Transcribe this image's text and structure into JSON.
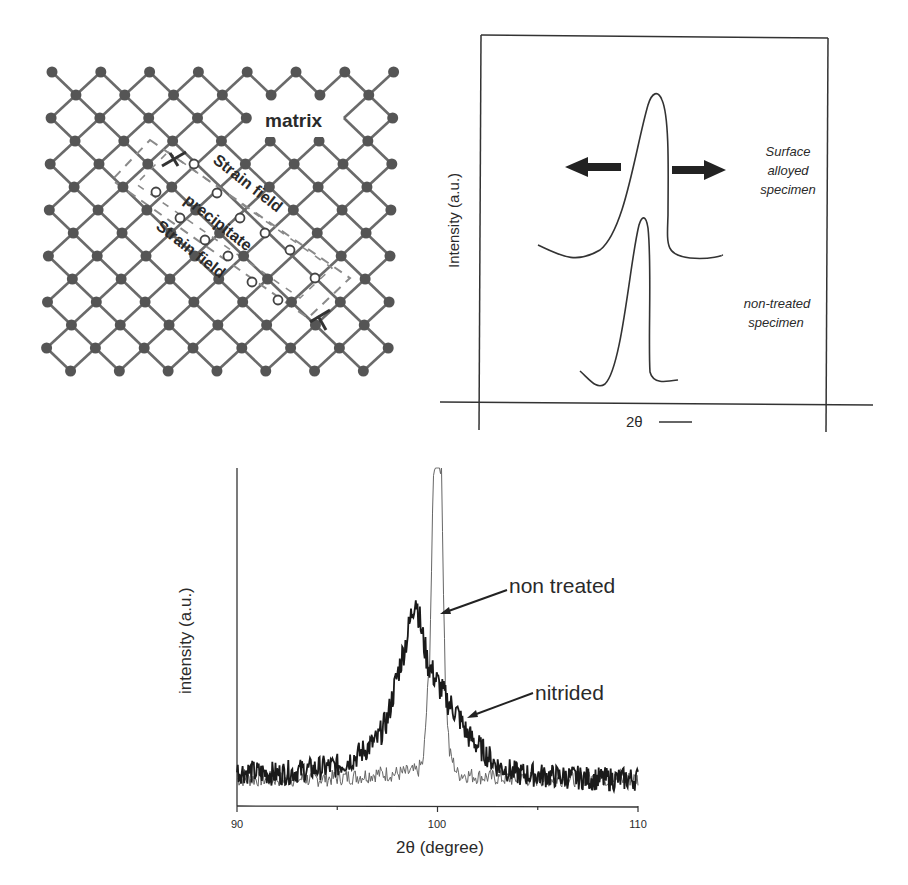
{
  "figure": {
    "lattice_diagram": {
      "labels": {
        "matrix": "matrix",
        "strain_field_upper": "Strain field",
        "precipitate": "precipitate",
        "strain_field_lower": "Strain field"
      },
      "colors": {
        "atom": "#555555",
        "bond": "#6a6a6a",
        "precipitate_atom": "#ffffff",
        "dash": "#8a8a8a"
      }
    },
    "schematic_chart": {
      "ylabel": "Intensity (a.u.)",
      "xlabel": "2θ",
      "xlabel_arrow": "⟶",
      "labels": {
        "surface_alloyed": [
          "Surface",
          "alloyed",
          "specimen"
        ],
        "non_treated": [
          "non-treated",
          "specimen"
        ]
      },
      "arrows": {
        "left": "broadening-left",
        "right": "broadening-right"
      }
    },
    "xrd_chart": {
      "ylabel": "intensity (a.u.)",
      "xlabel": "2θ (degree)",
      "xticks": [
        "90",
        "100",
        "110"
      ],
      "annotations": {
        "non_treated": "non treated",
        "nitrided": "nitrided"
      }
    }
  },
  "chart_data": [
    {
      "type": "line",
      "title": "",
      "xlabel": "2θ",
      "ylabel": "Intensity (a.u.)",
      "grid": false,
      "legend": "none (inline text labels)",
      "axis_ticks": "none (schematic)",
      "series": [
        {
          "name": "Surface alloyed specimen",
          "shape": "broad asymmetric peak, broadened both directions (arrows)",
          "relative_peak_height": 1.0,
          "relative_width": "wide"
        },
        {
          "name": "non-treated specimen",
          "shape": "narrow sharp peak",
          "relative_peak_height": 0.6,
          "relative_width": "narrow"
        }
      ],
      "annotations": [
        "left arrow (peak broadening)",
        "right arrow (peak broadening)"
      ]
    },
    {
      "type": "line",
      "title": "",
      "xlabel": "2θ (degree)",
      "ylabel": "intensity (a.u.)",
      "xlim": [
        90,
        110
      ],
      "xticks": [
        90,
        95,
        100,
        105,
        110
      ],
      "xtick_labels": [
        "90",
        "",
        "100",
        "",
        "110"
      ],
      "grid": false,
      "legend": "none (inline annotations with arrows)",
      "series": [
        {
          "name": "non treated",
          "style": "thin gray line",
          "peak_position_deg": 100.0,
          "x": [
            90,
            92,
            94,
            96,
            97,
            98,
            99,
            99.3,
            99.6,
            99.8,
            100.0,
            100.2,
            100.4,
            100.6,
            101,
            102,
            104,
            106,
            108,
            110
          ],
          "y": [
            0.05,
            0.05,
            0.05,
            0.06,
            0.07,
            0.07,
            0.08,
            0.12,
            0.5,
            1.2,
            1.5,
            1.2,
            0.4,
            0.15,
            0.07,
            0.06,
            0.05,
            0.05,
            0.05,
            0.05
          ],
          "note": "peak exceeds top of plot (clipped)"
        },
        {
          "name": "nitrided",
          "style": "thick dark noisy line",
          "peak_position_deg": 98.9,
          "x": [
            90,
            92,
            94,
            95,
            96,
            97,
            97.5,
            98,
            98.5,
            98.9,
            99.2,
            99.5,
            100,
            100.5,
            101,
            101.5,
            102,
            103,
            104,
            106,
            108,
            110
          ],
          "y": [
            0.08,
            0.07,
            0.09,
            0.1,
            0.14,
            0.2,
            0.28,
            0.45,
            0.6,
            0.76,
            0.62,
            0.5,
            0.42,
            0.35,
            0.3,
            0.22,
            0.18,
            0.1,
            0.07,
            0.06,
            0.05,
            0.05
          ]
        }
      ]
    }
  ]
}
